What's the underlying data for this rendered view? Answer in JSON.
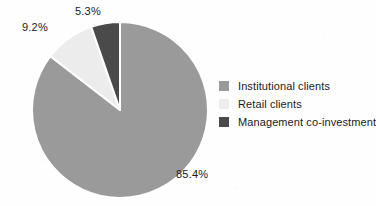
{
  "chart_data": {
    "type": "pie",
    "title": "",
    "subtitle": "",
    "xlabel": "",
    "ylabel": "",
    "grid": false,
    "legend_position": "right",
    "start_angle_deg": 0,
    "direction": "clockwise",
    "categories": [
      "Institutional clients",
      "Retail clients",
      "Management co-investment"
    ],
    "values": [
      85.4,
      9.2,
      5.3
    ],
    "value_unit": "%",
    "data_labels": [
      "85.4%",
      "9.2%",
      "5.3%"
    ],
    "colors": [
      "#9a9a9a",
      "#ececec",
      "#4a4a4a"
    ],
    "slice_separator_color": "#ffffff",
    "background_color": "#fefefe",
    "text_color": "#1b1b1b"
  },
  "pie": {
    "center_x": 120,
    "center_y": 110,
    "radius": 88,
    "slices": [
      {
        "label": "Institutional clients",
        "value": 85.4,
        "display": "85.4%",
        "color": "#9a9a9a",
        "label_x": 176,
        "label_y": 168
      },
      {
        "label": "Retail clients",
        "value": 9.2,
        "display": "9.2%",
        "color": "#ececec",
        "label_x": 22,
        "label_y": 21
      },
      {
        "label": "Management co-investment",
        "value": 5.3,
        "display": "5.3%",
        "color": "#4a4a4a",
        "label_x": 75,
        "label_y": 5
      }
    ]
  },
  "legend": {
    "items": [
      {
        "label": "Institutional clients",
        "color": "#9a9a9a"
      },
      {
        "label": "Retail clients",
        "color": "#ececec"
      },
      {
        "label": "Management co-investment",
        "color": "#4a4a4a"
      }
    ]
  }
}
